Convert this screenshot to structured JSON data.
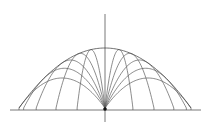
{
  "diagram": {
    "type": "projectile-trajectories-with-envelope",
    "colors": {
      "background": "#ffffff",
      "axis": "#555555",
      "trajectory": "#5a5a5a",
      "envelope": "#4a4a4a",
      "origin_marker": "#111111"
    },
    "origin_px": [
      105,
      108
    ],
    "axes": {
      "horizontal": {
        "x1": 10,
        "x2": 201,
        "y": 110
      },
      "vertical": {
        "x": 105,
        "y1": 14,
        "y2": 122
      }
    },
    "scale_px": {
      "range_max": 86,
      "height_scale": 120
    },
    "envelope": {
      "label": "",
      "peak_height_px": 60,
      "reach_px": 86
    },
    "launch_tan_values": [
      1.0,
      1.4,
      2.0,
      3.2,
      6.0
    ],
    "symmetric": true
  }
}
